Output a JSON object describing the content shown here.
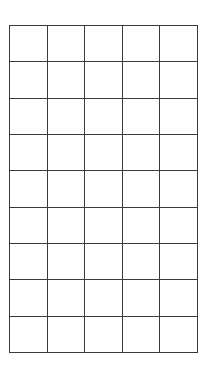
{
  "grid": {
    "rows": 9,
    "columns": 5,
    "line_color": "#3a3a3a",
    "background_color": "#ffffff",
    "cells": [
      [
        "",
        "",
        "",
        "",
        ""
      ],
      [
        "",
        "",
        "",
        "",
        ""
      ],
      [
        "",
        "",
        "",
        "",
        ""
      ],
      [
        "",
        "",
        "",
        "",
        ""
      ],
      [
        "",
        "",
        "",
        "",
        ""
      ],
      [
        "",
        "",
        "",
        "",
        ""
      ],
      [
        "",
        "",
        "",
        "",
        ""
      ],
      [
        "",
        "",
        "",
        "",
        ""
      ],
      [
        "",
        "",
        "",
        "",
        ""
      ]
    ]
  }
}
